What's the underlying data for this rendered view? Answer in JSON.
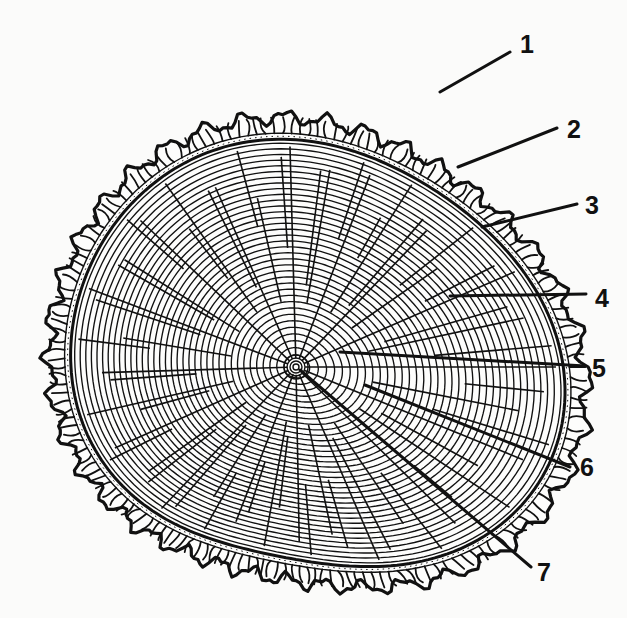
{
  "figure": {
    "colors": {
      "ink": "#111111",
      "paper": "#fbfbfa"
    },
    "center": {
      "x": 296,
      "y": 367
    },
    "callouts": [
      {
        "number": "1",
        "label_x": 520,
        "label_y": 32,
        "line_from": [
          510,
          52
        ],
        "line_to": [
          440,
          92
        ]
      },
      {
        "number": "2",
        "label_x": 567,
        "label_y": 117,
        "line_from": [
          557,
          128
        ],
        "line_to": [
          458,
          167
        ]
      },
      {
        "number": "3",
        "label_x": 585,
        "label_y": 193,
        "line_from": [
          577,
          204
        ],
        "line_to": [
          482,
          227
        ]
      },
      {
        "number": "4",
        "label_x": 595,
        "label_y": 286,
        "line_from": [
          586,
          294
        ],
        "line_to": [
          450,
          296
        ]
      },
      {
        "number": "5",
        "label_x": 592,
        "label_y": 356,
        "line_from": [
          585,
          366
        ],
        "line_to": [
          340,
          352
        ]
      },
      {
        "number": "6",
        "label_x": 580,
        "label_y": 455,
        "line_from": [
          570,
          467
        ],
        "line_to": [
          365,
          385
        ]
      },
      {
        "number": "7",
        "label_x": 537,
        "label_y": 560,
        "line_from": [
          531,
          567
        ],
        "line_to": [
          300,
          370
        ]
      }
    ]
  }
}
